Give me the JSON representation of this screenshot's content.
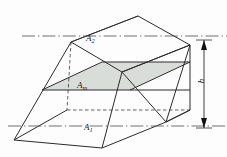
{
  "figure": {
    "type": "geometry-diagram",
    "labels": {
      "top_area": "A",
      "top_area_sub": "2",
      "mid_area": "A",
      "mid_area_sub": "m",
      "bottom_area": "A",
      "bottom_area_sub": "1",
      "height": "h"
    },
    "colors": {
      "line": "#2b2b2b",
      "mid_face_fill": "#d8dcd8",
      "background": "#fdfdfd",
      "centerline": "#555555"
    },
    "geometry": {
      "top_face": [
        [
          71,
          42
        ],
        [
          138,
          16
        ],
        [
          190,
          45
        ],
        [
          122,
          72
        ]
      ],
      "bottom_face": [
        [
          14,
          140
        ],
        [
          67,
          110
        ],
        [
          190,
          110
        ],
        [
          138,
          140
        ]
      ],
      "mid_face": [
        [
          42,
          90
        ],
        [
          102,
          62
        ],
        [
          190,
          62
        ],
        [
          130,
          90
        ]
      ],
      "centerlines": [
        {
          "name": "top-centerline",
          "y": 36,
          "x1": 22,
          "x2": 227
        },
        {
          "name": "bottom-centerline",
          "y": 126,
          "x1": 8,
          "x2": 227
        }
      ],
      "dimension_line": {
        "name": "height-dimension",
        "x": 204,
        "y1": 42,
        "y2": 127
      }
    }
  }
}
